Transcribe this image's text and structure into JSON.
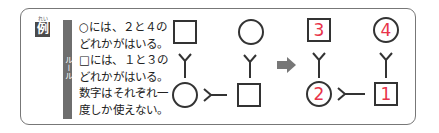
{
  "example": {
    "label": "例",
    "ruby": "れい"
  },
  "rule": {
    "tag": "ルール",
    "lines": [
      "○には、２と４の",
      "どれかがはいる。",
      "□には、１と３の",
      "どれかがはいる。",
      "数字はそれぞれ一",
      "度しか使えない。"
    ]
  },
  "puzzle": {
    "top_left": {
      "shape": "square",
      "value": ""
    },
    "top_right": {
      "shape": "circle",
      "value": ""
    },
    "bottom_left": {
      "shape": "circle",
      "value": ""
    },
    "bottom_right": {
      "shape": "square",
      "value": ""
    }
  },
  "answer": {
    "top_left": {
      "shape": "square",
      "value": "3"
    },
    "top_right": {
      "shape": "circle",
      "value": "4"
    },
    "bottom_left": {
      "shape": "circle",
      "value": "2"
    },
    "bottom_right": {
      "shape": "square",
      "value": "1"
    }
  },
  "arrow": "right-arrow",
  "colors": {
    "answer_number": "#e8334a",
    "line": "#333333",
    "arrow": "#777777",
    "rule_bar": "#6e6e6e"
  }
}
